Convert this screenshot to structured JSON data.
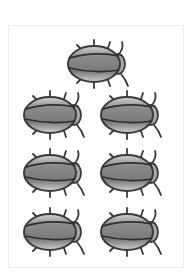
{
  "illustration": {
    "subject": "beetles",
    "count": 7,
    "colors": {
      "outline": "#3a3a3a",
      "shell_dark": "#7d7d7d",
      "shell_light": "#c9c9c9",
      "frame_border": "#ececec"
    },
    "bugs": [
      {
        "x": 64,
        "y": 38
      },
      {
        "x": 20,
        "y": 89
      },
      {
        "x": 97,
        "y": 89
      },
      {
        "x": 20,
        "y": 147
      },
      {
        "x": 97,
        "y": 147
      },
      {
        "x": 20,
        "y": 206
      },
      {
        "x": 97,
        "y": 206
      }
    ]
  }
}
